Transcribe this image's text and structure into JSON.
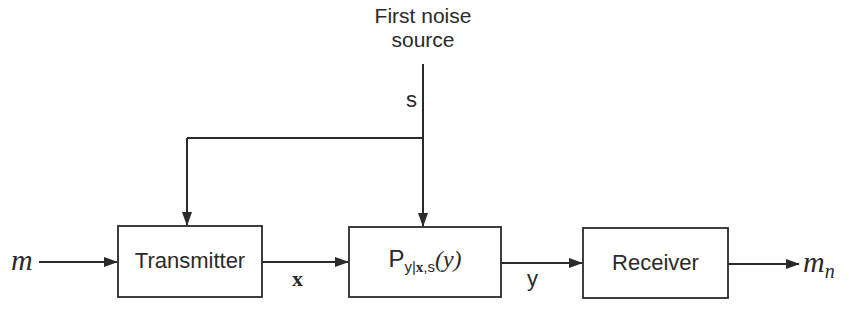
{
  "diagram": {
    "noise_source": {
      "line1": "First noise",
      "line2": "source",
      "signal_label": "s"
    },
    "blocks": {
      "transmitter": {
        "label": "Transmitter"
      },
      "channel": {
        "label_main": "P",
        "label_sub_y": "y|",
        "label_sub_x": "x",
        "label_sub_comma": ",",
        "label_sub_s": "s",
        "label_arg": "(y)"
      },
      "receiver": {
        "label": "Receiver"
      }
    },
    "signals": {
      "input": "m",
      "tx_to_channel": "x",
      "channel_to_rx": "y",
      "output_main": "m",
      "output_sub": "n"
    },
    "colors": {
      "line": "#2a2a2a",
      "text": "#2a2a2a",
      "background": "#ffffff"
    }
  }
}
